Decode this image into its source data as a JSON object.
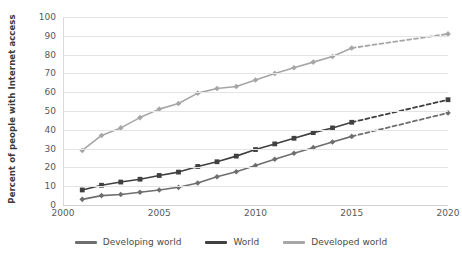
{
  "chart_data": {
    "type": "line",
    "title": "",
    "xlabel": "",
    "ylabel": "Percent of people with Internet access",
    "xlim": [
      2000,
      2020
    ],
    "ylim": [
      0,
      100
    ],
    "grid": true,
    "legend_position": "bottom",
    "x_ticks": [
      "2000",
      "2005",
      "2010",
      "2015",
      "2020"
    ],
    "y_ticks": [
      "0",
      "10",
      "20",
      "30",
      "40",
      "50",
      "60",
      "70",
      "80",
      "90",
      "100"
    ],
    "x": [
      2001,
      2002,
      2003,
      2004,
      2005,
      2006,
      2007,
      2008,
      2009,
      2010,
      2011,
      2012,
      2013,
      2014,
      2015,
      2020
    ],
    "series": [
      {
        "name": "Developed world",
        "color": "#a6a6a6",
        "marker": "diamond",
        "solid_through": 2015,
        "projection_from": 2015,
        "values": [
          29,
          37,
          41,
          46.5,
          51,
          54,
          59.5,
          62,
          63,
          66.5,
          70,
          73,
          76,
          79,
          83.5,
          91
        ]
      },
      {
        "name": "World",
        "color": "#404040",
        "marker": "square",
        "solid_through": 2015,
        "projection_from": 2015,
        "values": [
          8,
          10.5,
          12.2,
          13.7,
          15.7,
          17.5,
          20.5,
          23,
          26,
          29.5,
          32.5,
          35.5,
          38.5,
          41,
          44,
          56
        ]
      },
      {
        "name": "Developing world",
        "color": "#6e6e6e",
        "marker": "diamond",
        "solid_through": 2015,
        "projection_from": 2015,
        "values": [
          3,
          5,
          5.6,
          6.8,
          8,
          9.4,
          11.7,
          15,
          17.7,
          21,
          24.3,
          27.5,
          30.5,
          33.5,
          36.5,
          49
        ]
      }
    ],
    "legend": [
      {
        "label": "Developing world",
        "color": "#6e6e6e"
      },
      {
        "label": "World",
        "color": "#404040"
      },
      {
        "label": "Developed world",
        "color": "#a6a6a6"
      }
    ]
  }
}
